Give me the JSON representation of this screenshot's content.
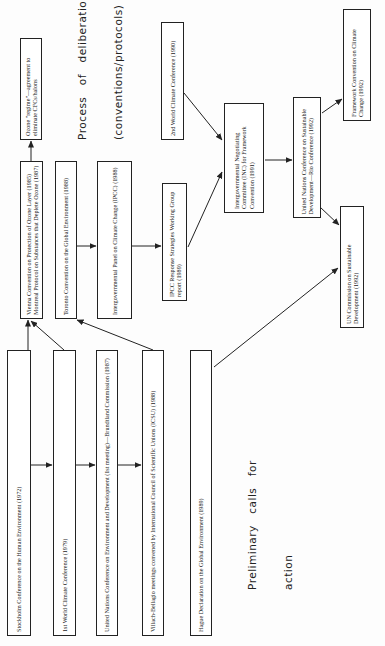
{
  "orientation": "rotated -90deg (text reads bottom to top)",
  "section_labels": {
    "deliberation_line1": "Process   of   deliberation",
    "deliberation_line2": "(conventions/protocols)",
    "preliminary_line1": "Preliminary   calls   for",
    "preliminary_line2": "action"
  },
  "nodes": [
    {
      "id": "stockholm",
      "text": "Stockholm Conference on the Human Environment (1972)",
      "box": [
        7,
        350,
        24,
        286
      ]
    },
    {
      "id": "wcc1",
      "text": "1st World Climate Conference (1979)",
      "box": [
        53,
        350,
        23,
        286
      ]
    },
    {
      "id": "brundtland",
      "text": "United Nations Conference on Environment and Development (1st meeting)—Brundtland Commission (1987)",
      "box": [
        96,
        350,
        22,
        286
      ]
    },
    {
      "id": "villach",
      "text": "Villach-Bellagio meetings convened by International Council of Scientific Unions (ICSU) (1988)",
      "box": [
        142,
        350,
        22,
        286
      ]
    },
    {
      "id": "hague",
      "text": "Hague Declaration on the Global Environment (1989)",
      "box": [
        190,
        350,
        22,
        286
      ]
    },
    {
      "id": "vienna",
      "text": "Vienna Convention on Protection of Ozone Layer (1985) Montreal Protocol on Substances that Deplete Ozone (1987)",
      "box": [
        20,
        161,
        23,
        158
      ]
    },
    {
      "id": "ozone",
      "text": "Ozone \"regime\"—agreement to eliminate CFCs/halons",
      "box": [
        20,
        38,
        22,
        102
      ]
    },
    {
      "id": "toronto",
      "text": "Toronto Convention on the Global Environment (1988)",
      "box": [
        55,
        161,
        22,
        158
      ]
    },
    {
      "id": "ipcc",
      "text": "Intergovernmental Panel on Climate Change (IPCC) (1988)",
      "box": [
        97,
        161,
        35,
        158
      ]
    },
    {
      "id": "ipcc_response",
      "text": "IPCC Response Strategies Working Group report (1989)",
      "box": [
        162,
        183,
        25,
        118
      ]
    },
    {
      "id": "wcc2",
      "text": "2nd World Climate Conference (1990)",
      "box": [
        161,
        22,
        23,
        118
      ]
    },
    {
      "id": "inc",
      "text": "Intergovernmental Negotiating Committee (INC) for Framework Convention (1991)",
      "box": [
        224,
        103,
        40,
        110
      ]
    },
    {
      "id": "unced",
      "text": "United Nations Conference on Sustainable Development—Rio Conference (1992)",
      "box": [
        293,
        97,
        28,
        121
      ]
    },
    {
      "id": "fccc",
      "text": "Framework Convention on Climate Change (1992)",
      "box": [
        343,
        9,
        28,
        112
      ]
    },
    {
      "id": "csd",
      "text": "UN Commission on Sustainable Development (1992)",
      "box": [
        340,
        206,
        24,
        122
      ]
    }
  ],
  "edges": [
    {
      "from": "stockholm",
      "to": "vienna",
      "line": [
        28,
        350,
        28,
        320
      ]
    },
    {
      "from": "stockholm",
      "to": "wcc1",
      "line": [
        30,
        465,
        52,
        465
      ]
    },
    {
      "from": "wcc1",
      "to": "vienna",
      "line": [
        64,
        350,
        31,
        321
      ]
    },
    {
      "from": "wcc1",
      "to": "brundtland",
      "line": [
        75,
        465,
        95,
        465
      ]
    },
    {
      "from": "brundtland",
      "to": "villach",
      "line": [
        118,
        465,
        141,
        465
      ]
    },
    {
      "from": "villach",
      "to": "toronto",
      "line": [
        153,
        350,
        77,
        320
      ]
    },
    {
      "from": "vienna",
      "to": "ozone",
      "line": [
        31,
        161,
        31,
        141
      ]
    },
    {
      "from": "toronto",
      "to": "ipcc",
      "line": [
        77,
        246,
        96,
        246
      ]
    },
    {
      "from": "ipcc",
      "to": "ipcc_response",
      "line": [
        132,
        246,
        161,
        246
      ]
    },
    {
      "from": "ipcc_response",
      "to": "inc",
      "line": [
        188,
        247,
        222,
        172
      ]
    },
    {
      "from": "wcc2",
      "to": "inc",
      "line": [
        184,
        93,
        222,
        140
      ]
    },
    {
      "from": "inc",
      "to": "unced",
      "line": [
        265,
        160,
        292,
        160
      ]
    },
    {
      "from": "unced",
      "to": "fccc",
      "line": [
        322,
        113,
        342,
        99
      ]
    },
    {
      "from": "unced",
      "to": "csd",
      "line": [
        320,
        207,
        339,
        225
      ]
    },
    {
      "from": "hague",
      "to": "csd",
      "line": [
        214,
        367,
        338,
        268
      ]
    }
  ]
}
